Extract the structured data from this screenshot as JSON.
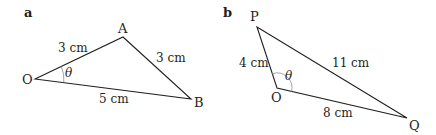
{
  "figures": [
    {
      "panel_label": "a",
      "vertices": {
        "O": {
          "label": "O",
          "x": 35,
          "y": 79
        },
        "A": {
          "label": "A",
          "x": 123,
          "y": 37
        },
        "B": {
          "label": "B",
          "x": 191,
          "y": 99
        }
      },
      "sides": {
        "OA": "3 cm",
        "AB": "3 cm",
        "OB": "5 cm"
      },
      "angle": {
        "vertex": "O",
        "symbol": "θ"
      }
    },
    {
      "panel_label": "b",
      "vertices": {
        "P": {
          "label": "P",
          "x": 257,
          "y": 27
        },
        "O": {
          "label": "O",
          "x": 277,
          "y": 88
        },
        "Q": {
          "label": "Q",
          "x": 407,
          "y": 118
        }
      },
      "sides": {
        "OP": "4 cm",
        "PQ": "11 cm",
        "OQ": "8 cm"
      },
      "angle": {
        "vertex": "O",
        "symbol": "θ"
      }
    }
  ]
}
